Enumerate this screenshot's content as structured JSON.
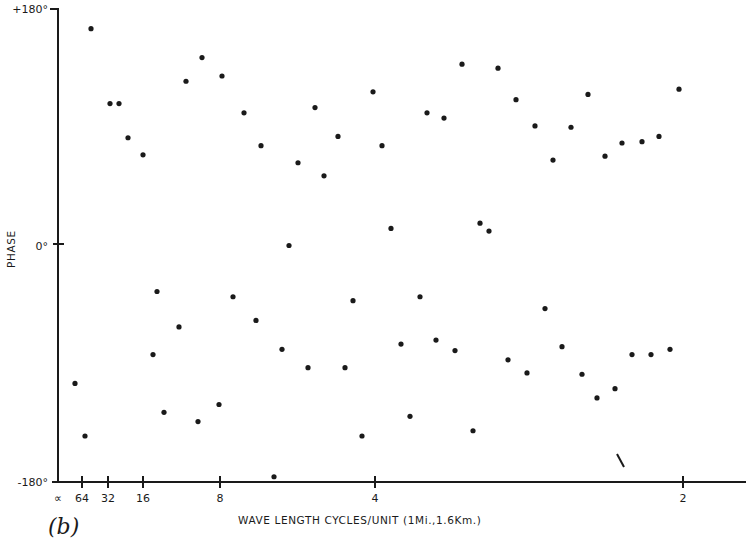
{
  "chart_data": {
    "type": "scatter",
    "title": "",
    "panel_label": "(b)",
    "xlabel": "WAVE LENGTH CYCLES/UNIT (1Mi.,1.6Km.)",
    "ylabel": "PHASE",
    "y_ticks": [
      {
        "label": "+180°",
        "value": 180
      },
      {
        "label": "0°",
        "value": 0
      },
      {
        "label": "-180°",
        "value": -180
      }
    ],
    "x_ticks": [
      {
        "label": "∝",
        "px": 58
      },
      {
        "label": "64",
        "px": 82
      },
      {
        "label": "32",
        "px": 108
      },
      {
        "label": "16",
        "px": 143
      },
      {
        "label": "8",
        "px": 220
      },
      {
        "label": "4",
        "px": 375
      },
      {
        "label": "2",
        "px": 683
      }
    ],
    "ylim": [
      -180,
      180
    ],
    "grid": false,
    "legend": null,
    "note": "x positions given in plot pixel coordinates along a nonlinear wavelength axis; y = phase in degrees",
    "points": [
      {
        "x": 75,
        "y": -105
      },
      {
        "x": 85,
        "y": -145
      },
      {
        "x": 91,
        "y": 165
      },
      {
        "x": 110,
        "y": 108
      },
      {
        "x": 119,
        "y": 108
      },
      {
        "x": 128,
        "y": 82
      },
      {
        "x": 143,
        "y": 69
      },
      {
        "x": 153,
        "y": -83
      },
      {
        "x": 157,
        "y": -35
      },
      {
        "x": 164,
        "y": -127
      },
      {
        "x": 179,
        "y": -62
      },
      {
        "x": 186,
        "y": 125
      },
      {
        "x": 198,
        "y": -134
      },
      {
        "x": 202,
        "y": 143
      },
      {
        "x": 219,
        "y": -121
      },
      {
        "x": 222,
        "y": 129
      },
      {
        "x": 233,
        "y": -39
      },
      {
        "x": 244,
        "y": 101
      },
      {
        "x": 256,
        "y": -57
      },
      {
        "x": 261,
        "y": 76
      },
      {
        "x": 274,
        "y": -176
      },
      {
        "x": 282,
        "y": -79
      },
      {
        "x": 289,
        "y": 0
      },
      {
        "x": 298,
        "y": 63
      },
      {
        "x": 308,
        "y": -93
      },
      {
        "x": 315,
        "y": 105
      },
      {
        "x": 324,
        "y": 53
      },
      {
        "x": 338,
        "y": 83
      },
      {
        "x": 345,
        "y": -93
      },
      {
        "x": 353,
        "y": -42
      },
      {
        "x": 362,
        "y": -145
      },
      {
        "x": 373,
        "y": 117
      },
      {
        "x": 382,
        "y": 76
      },
      {
        "x": 391,
        "y": 13
      },
      {
        "x": 401,
        "y": -75
      },
      {
        "x": 410,
        "y": -130
      },
      {
        "x": 420,
        "y": -39
      },
      {
        "x": 427,
        "y": 101
      },
      {
        "x": 436,
        "y": -72
      },
      {
        "x": 444,
        "y": 97
      },
      {
        "x": 455,
        "y": -80
      },
      {
        "x": 462,
        "y": 138
      },
      {
        "x": 473,
        "y": -141
      },
      {
        "x": 480,
        "y": 17
      },
      {
        "x": 489,
        "y": 11
      },
      {
        "x": 498,
        "y": 135
      },
      {
        "x": 508,
        "y": -87
      },
      {
        "x": 516,
        "y": 111
      },
      {
        "x": 527,
        "y": -97
      },
      {
        "x": 535,
        "y": 91
      },
      {
        "x": 545,
        "y": -48
      },
      {
        "x": 553,
        "y": 65
      },
      {
        "x": 562,
        "y": -77
      },
      {
        "x": 571,
        "y": 90
      },
      {
        "x": 582,
        "y": -98
      },
      {
        "x": 588,
        "y": 115
      },
      {
        "x": 597,
        "y": -116
      },
      {
        "x": 605,
        "y": 68
      },
      {
        "x": 615,
        "y": -109
      },
      {
        "x": 622,
        "y": 78
      },
      {
        "x": 632,
        "y": -83
      },
      {
        "x": 642,
        "y": 79
      },
      {
        "x": 651,
        "y": -83
      },
      {
        "x": 659,
        "y": 83
      },
      {
        "x": 670,
        "y": -79
      },
      {
        "x": 679,
        "y": 119
      }
    ],
    "annotations": [
      {
        "type": "stray-stroke",
        "x": 620,
        "y": -164
      }
    ]
  }
}
